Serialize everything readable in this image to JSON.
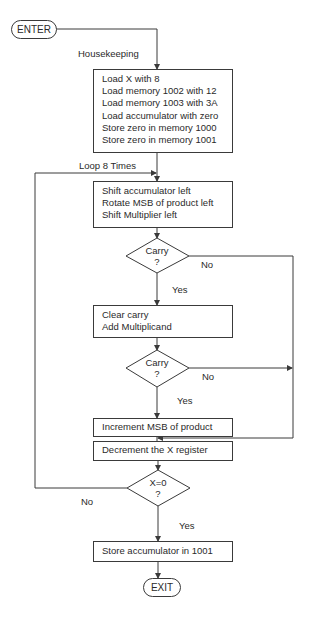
{
  "flowchart": {
    "start": {
      "label": "ENTER"
    },
    "end": {
      "label": "EXIT"
    },
    "labels": {
      "housekeeping": "Housekeeping",
      "loop": "Loop 8 Times"
    },
    "boxes": [
      {
        "id": "housekeeping",
        "lines": [
          "Load X with 8",
          "Load memory 1002 with 12",
          "Load memory 1003 with 3A",
          "Load accumulator with zero",
          "Store zero in memory 1000",
          "Store zero in memory 1001"
        ]
      },
      {
        "id": "shift",
        "lines": [
          "Shift accumulator left",
          "Rotate MSB of product left",
          "Shift Multiplier left"
        ]
      },
      {
        "id": "add",
        "lines": [
          "Clear carry",
          "Add Multiplicand"
        ]
      },
      {
        "id": "increment",
        "lines": [
          "Increment MSB of product"
        ]
      },
      {
        "id": "decrement",
        "lines": [
          "Decrement the X register"
        ]
      },
      {
        "id": "store",
        "lines": [
          "Store accumulator in 1001"
        ]
      }
    ],
    "decisions": [
      {
        "id": "carry1",
        "line1": "Carry",
        "line2": "?",
        "yes": "Yes",
        "no": "No"
      },
      {
        "id": "carry2",
        "line1": "Carry",
        "line2": "?",
        "yes": "Yes",
        "no": "No"
      },
      {
        "id": "x-zero",
        "line1": "X=0",
        "line2": "?",
        "yes": "Yes",
        "no": "No"
      }
    ]
  },
  "colors": {
    "line": "#3a3a3a",
    "background": "#ffffff"
  }
}
